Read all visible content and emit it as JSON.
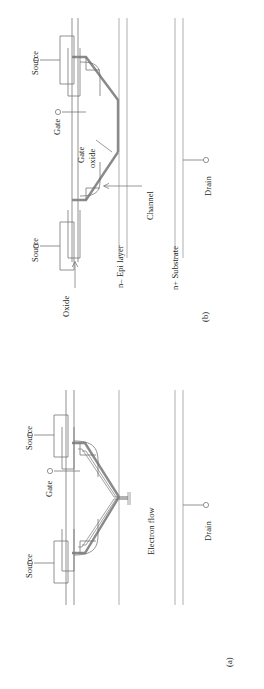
{
  "figure": {
    "type": "semiconductor-device-cross-section",
    "orientation": "rotated-90-ccw",
    "panels": [
      {
        "id": "b",
        "tag": "(b)",
        "labels": {
          "source_left": "Source",
          "source_right": "Source",
          "gate": "Gate",
          "gate_oxide": "Gate\noxide",
          "gate_oxide_line1": "Gate",
          "gate_oxide_line2": "oxide",
          "channel": "Channel",
          "oxide": "Oxide",
          "epi_layer": "n– Epi layer",
          "substrate": "n+ Substrate",
          "drain": "Drain"
        }
      },
      {
        "id": "a",
        "tag": "(a)",
        "labels": {
          "source_left": "Source",
          "source_right": "Source",
          "gate": "Gate",
          "electron_flow": "Electron flow",
          "drain": "Drain"
        }
      }
    ],
    "colors": {
      "stroke": "#6f6f70",
      "thick_stroke": "#8a8a8c",
      "text": "#231f20",
      "background": "#ffffff"
    }
  }
}
